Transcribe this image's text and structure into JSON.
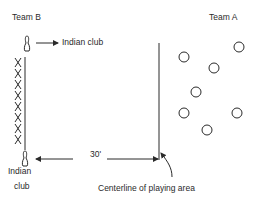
{
  "labels": {
    "team_b": "Team B",
    "team_a": "Team A",
    "indian_club_top": "Indian club",
    "indian_club_bottom_line1": "Indian",
    "indian_club_bottom_line2": "club",
    "distance": "30'",
    "centerline": "Centerline of playing area"
  },
  "team_b": {
    "marker": "X",
    "players": [
      {
        "x": 18,
        "y": 62
      },
      {
        "x": 18,
        "y": 73
      },
      {
        "x": 18,
        "y": 84
      },
      {
        "x": 18,
        "y": 95
      },
      {
        "x": 18,
        "y": 106
      },
      {
        "x": 18,
        "y": 117
      },
      {
        "x": 18,
        "y": 128
      },
      {
        "x": 18,
        "y": 139
      }
    ]
  },
  "team_a": {
    "marker": "circle",
    "players": [
      {
        "x": 239,
        "y": 47
      },
      {
        "x": 184,
        "y": 57
      },
      {
        "x": 214,
        "y": 68
      },
      {
        "x": 196,
        "y": 92
      },
      {
        "x": 184,
        "y": 113
      },
      {
        "x": 237,
        "y": 113
      },
      {
        "x": 207,
        "y": 130
      }
    ]
  },
  "colors": {
    "ink": "#2a2a2a",
    "background": "#ffffff"
  }
}
